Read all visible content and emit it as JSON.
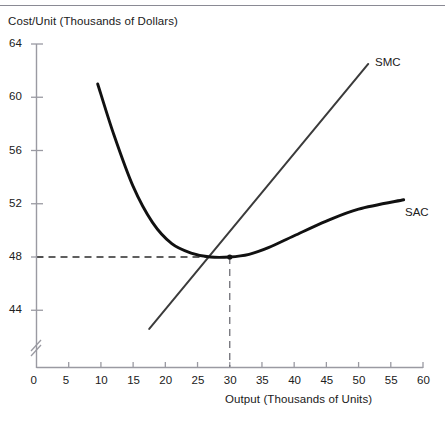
{
  "chart_data": {
    "type": "line",
    "title": "",
    "xlabel": "Output (Thousands of Units)",
    "ylabel": "Cost/Unit (Thousands of Dollars)",
    "xlim": [
      0,
      60
    ],
    "ylim": [
      42,
      64
    ],
    "y_axis_break": true,
    "grid": false,
    "legend_position": "inline-right",
    "xticks": [
      0,
      5,
      10,
      15,
      20,
      25,
      30,
      35,
      40,
      45,
      50,
      55,
      60
    ],
    "xtick_labels": [
      "0",
      "5",
      "10",
      "15",
      "20",
      "25",
      "30",
      "35",
      "40",
      "45",
      "50",
      "55",
      "60"
    ],
    "yticks": [
      44,
      48,
      52,
      56,
      60,
      64
    ],
    "ytick_labels": [
      "44",
      "48",
      "52",
      "56",
      "60",
      "64"
    ],
    "series": [
      {
        "name": "SMC",
        "label": "SMC",
        "shape": "straight-line",
        "color": "#3b3b3b",
        "points": [
          {
            "x": 17.5,
            "y": 42.6
          },
          {
            "x": 20,
            "y": 44.2
          },
          {
            "x": 25,
            "y": 47.4
          },
          {
            "x": 30,
            "y": 48.0
          },
          {
            "x": 30,
            "y": 50.6
          },
          {
            "x": 35,
            "y": 53.8
          },
          {
            "x": 40,
            "y": 57.0
          },
          {
            "x": 45,
            "y": 60.2
          },
          {
            "x": 51.5,
            "y": 62.5
          }
        ]
      },
      {
        "name": "SAC",
        "label": "SAC",
        "shape": "u-curve",
        "color": "#111111",
        "points": [
          {
            "x": 9.5,
            "y": 61.0
          },
          {
            "x": 12,
            "y": 57.2
          },
          {
            "x": 15,
            "y": 53.3
          },
          {
            "x": 18,
            "y": 50.6
          },
          {
            "x": 21,
            "y": 49.0
          },
          {
            "x": 24,
            "y": 48.3
          },
          {
            "x": 27,
            "y": 48.0
          },
          {
            "x": 30,
            "y": 48.0
          },
          {
            "x": 33,
            "y": 48.2
          },
          {
            "x": 36,
            "y": 48.7
          },
          {
            "x": 40,
            "y": 49.6
          },
          {
            "x": 45,
            "y": 50.7
          },
          {
            "x": 50,
            "y": 51.6
          },
          {
            "x": 57,
            "y": 52.3
          }
        ]
      }
    ],
    "annotations": [
      {
        "name": "efficient-scale-point",
        "type": "intersection",
        "x": 30,
        "y": 48,
        "note": "SMC intersects SAC at minimum of SAC"
      },
      {
        "name": "horizontal-guide-48",
        "type": "dashed-horizontal",
        "y": 48,
        "from_x": 0,
        "to_x": 30
      },
      {
        "name": "vertical-guide-30",
        "type": "dashed-vertical",
        "x": 30,
        "from_y": 42,
        "to_y": 48
      }
    ]
  },
  "axes": {
    "y_title": "Cost/Unit (Thousands of Dollars)",
    "x_title": "Output (Thousands of Units)"
  },
  "labels": {
    "smc": "SMC",
    "sac": "SAC"
  }
}
